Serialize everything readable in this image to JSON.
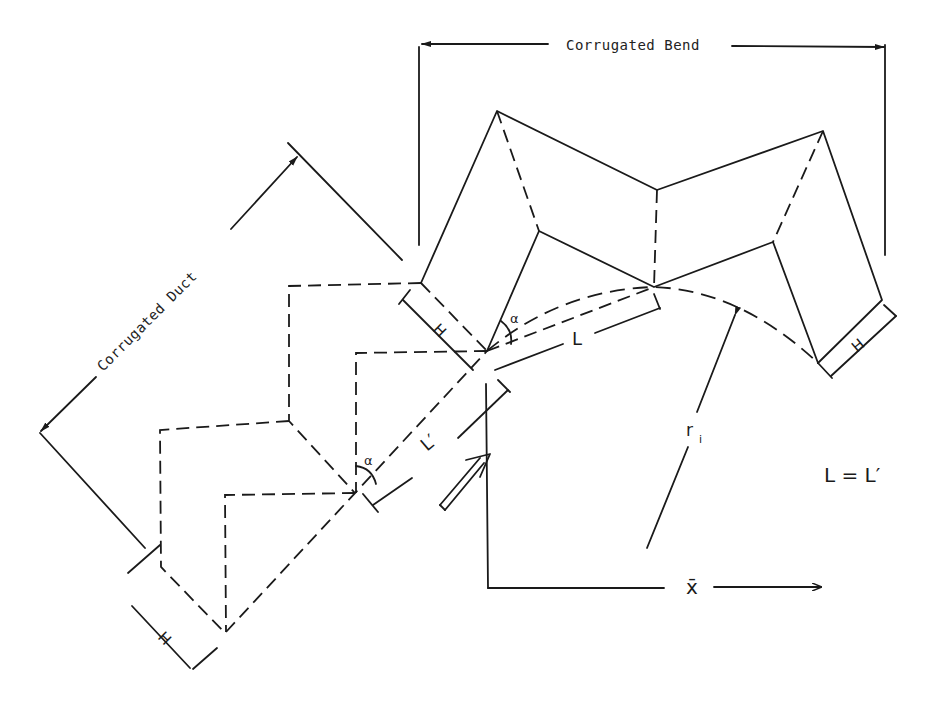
{
  "diagram": {
    "title_labels": {
      "bend": "Corrugated Bend",
      "duct": "Corrugated Duct"
    },
    "symbols": {
      "height_bend": "H",
      "height_duct_upper": "H",
      "height_duct_lower": "H",
      "length_bend": "L",
      "length_duct": "L′",
      "angle_bend": "α",
      "angle_duct": "α",
      "radius": "r",
      "radius_sub": "i",
      "axis_x": "x̄",
      "equation": "L = L′"
    },
    "colors": {
      "ink": "#1a1a1a",
      "paper": "#ffffff"
    }
  }
}
